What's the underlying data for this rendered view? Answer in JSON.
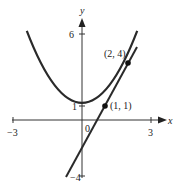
{
  "figure": {
    "axes": {
      "x_label": "x",
      "y_label": "y",
      "origin_label": "0",
      "x_ticks": [
        {
          "value": -3,
          "label": "−3"
        },
        {
          "value": 3,
          "label": "3"
        }
      ],
      "y_ticks": [
        {
          "value": 6,
          "label": "6"
        },
        {
          "value": 1,
          "label": "1"
        },
        {
          "value": -4,
          "label": "−4"
        }
      ],
      "xlim": [
        -3.4,
        3.4
      ],
      "ylim": [
        -4.2,
        6.8
      ]
    },
    "curve": {
      "name": "parabola",
      "equation": "y = x^2",
      "color": "#2a2a2a"
    },
    "line": {
      "name": "secant",
      "equation": "y = 3x - 2",
      "color": "#2a2a2a"
    },
    "points": [
      {
        "x": 1,
        "y": 1,
        "label": "(1, 1)"
      },
      {
        "x": 2,
        "y": 4,
        "label": "(2, 4)"
      }
    ]
  }
}
